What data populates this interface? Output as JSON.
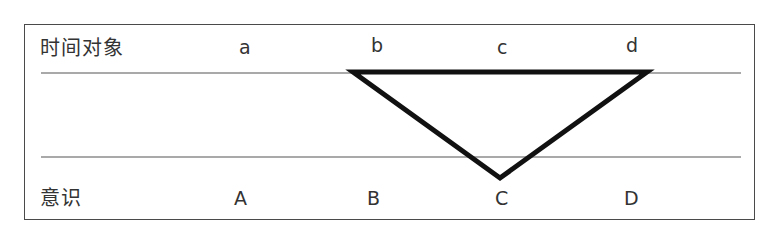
{
  "diagram": {
    "top_row": {
      "title": "时间对象",
      "labels": [
        "a",
        "b",
        "c",
        "d"
      ]
    },
    "bottom_row": {
      "title": "意识",
      "labels": [
        "A",
        "B",
        "C",
        "D"
      ]
    },
    "colors": {
      "frame": "#4a4a4a",
      "guide_lines": "#555555",
      "triangle": "#111111",
      "text": "#333333"
    },
    "shape": {
      "type": "inverted-triangle",
      "vertices": [
        "b (top-left)",
        "d (top-right)",
        "C (bottom)"
      ]
    }
  }
}
